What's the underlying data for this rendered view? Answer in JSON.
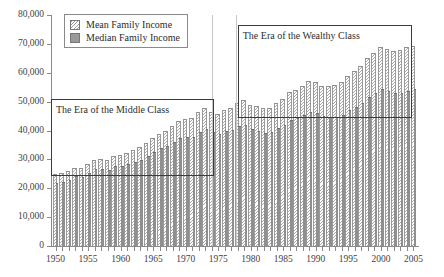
{
  "chart_data": {
    "type": "bar",
    "title": "",
    "xlabel": "",
    "ylabel": "",
    "ylim": [
      0,
      80000
    ],
    "ytick_labels": [
      "0",
      "10,000",
      "20,000",
      "30,000",
      "40,000",
      "50,000",
      "60,000",
      "70,000",
      "80,000"
    ],
    "ytick_values": [
      0,
      10000,
      20000,
      30000,
      40000,
      50000,
      60000,
      70000,
      80000
    ],
    "xtick_labels": [
      "1950",
      "1955",
      "1960",
      "1965",
      "1970",
      "1975",
      "1980",
      "1985",
      "1990",
      "1995",
      "2000",
      "2005"
    ],
    "grid": false,
    "legend_position": "top-left-inside",
    "x": [
      1950,
      1951,
      1952,
      1953,
      1954,
      1955,
      1956,
      1957,
      1958,
      1959,
      1960,
      1961,
      1962,
      1963,
      1964,
      1965,
      1966,
      1967,
      1968,
      1969,
      1970,
      1971,
      1972,
      1973,
      1974,
      1975,
      1976,
      1977,
      1978,
      1979,
      1980,
      1981,
      1982,
      1983,
      1984,
      1985,
      1986,
      1987,
      1988,
      1989,
      1990,
      1991,
      1992,
      1993,
      1994,
      1995,
      1996,
      1997,
      1998,
      1999,
      2000,
      2001,
      2002,
      2003,
      2004,
      2005
    ],
    "series": [
      {
        "name": "Mean Family Income",
        "pattern": "hatched",
        "values": [
          24500,
          25000,
          25600,
          26800,
          26700,
          28200,
          29600,
          29700,
          29400,
          30900,
          31300,
          31900,
          32900,
          33900,
          35400,
          36900,
          38500,
          39600,
          41300,
          43000,
          43600,
          43900,
          46100,
          47500,
          46200,
          45500,
          46900,
          47500,
          49200,
          50100,
          48500,
          48000,
          47300,
          47600,
          49300,
          50700,
          52900,
          53800,
          55100,
          56700,
          56400,
          55200,
          55100,
          55500,
          56600,
          58400,
          60100,
          62100,
          64700,
          66600,
          68600,
          67900,
          67300,
          67500,
          68500,
          69000
        ]
      },
      {
        "name": "Median Family Income",
        "pattern": "solid",
        "values": [
          21400,
          21900,
          22400,
          23800,
          23500,
          24900,
          26200,
          26200,
          25900,
          27300,
          27500,
          28000,
          28800,
          29600,
          30900,
          32100,
          33500,
          34300,
          35700,
          37100,
          37300,
          37400,
          39100,
          40200,
          39100,
          38400,
          39500,
          39900,
          41200,
          41700,
          40100,
          39500,
          38900,
          39000,
          40400,
          41400,
          43300,
          44100,
          44900,
          46100,
          45700,
          44600,
          44300,
          44300,
          45200,
          46800,
          47800,
          49100,
          51400,
          52700,
          54100,
          53400,
          52800,
          52700,
          53400,
          54000
        ]
      }
    ],
    "annotations": [
      {
        "id": "era-middle-class",
        "text": "The Era of the Middle Class",
        "box_x_range": [
          1949.3,
          1974.0
        ],
        "box_y_range": [
          25000,
          50800
        ]
      },
      {
        "id": "era-wealthy-class",
        "text": "The Era of the Wealthy Class",
        "box_x_range": [
          1978.0,
          1980.0
        ],
        "box_y_range": [
          45000,
          76500
        ]
      }
    ],
    "vertical_markers": [
      1974.0,
      1977.8
    ]
  },
  "legend": {
    "items": [
      {
        "label": "Mean Family Income",
        "swatch": "hatched-swatch"
      },
      {
        "label": "Median Family Income",
        "swatch": "solid-gray-swatch"
      }
    ]
  },
  "colors": {
    "mean_bar": "#a8a8a8",
    "median_bar": "#8f8f8f",
    "axis": "#8a8a8a",
    "annotation_border": "#3b3b3b",
    "vertical_marker": "#c9c9c9",
    "text": "#3a3a3a"
  }
}
